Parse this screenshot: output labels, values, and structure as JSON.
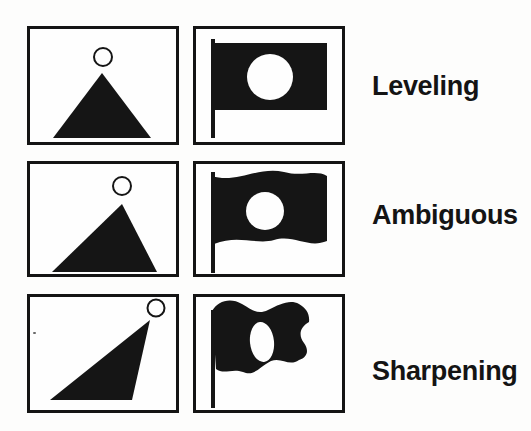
{
  "figure": {
    "rows": [
      {
        "label": "Leveling",
        "left_shape": "symmetric-triangle-with-circle-above-apex",
        "right_shape": "rectangular-flag-on-pole-with-white-circle-hole"
      },
      {
        "label": "Ambiguous",
        "left_shape": "slightly-skewed-triangle-with-circle-above-apex",
        "right_shape": "gently-waving-flag-on-pole-with-white-circle-hole"
      },
      {
        "label": "Sharpening",
        "left_shape": "strongly-skewed-triangle-with-circle-at-apex",
        "right_shape": "strongly-waving-flag-on-pole-with-white-oval-hole"
      }
    ],
    "colors": {
      "ink": "#151515",
      "background": "#fdfdfc"
    }
  }
}
